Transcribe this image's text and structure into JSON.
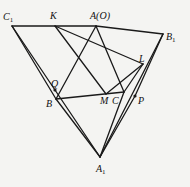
{
  "diagram": {
    "type": "geometry",
    "points": {
      "C1": {
        "x": 12,
        "y": 26,
        "label": "C",
        "sub": "1",
        "lx": 3,
        "ly": 20
      },
      "K": {
        "x": 55,
        "y": 26,
        "label": "K",
        "sub": "",
        "lx": 50,
        "ly": 19
      },
      "A": {
        "x": 96,
        "y": 26,
        "label": "A(O)",
        "sub": "",
        "lx": 90,
        "ly": 19
      },
      "B1": {
        "x": 163,
        "y": 34,
        "label": "B",
        "sub": "1",
        "lx": 166,
        "ly": 40
      },
      "L": {
        "x": 143,
        "y": 64,
        "label": "L",
        "sub": "",
        "lx": 139,
        "ly": 62
      },
      "Q": {
        "x": 55,
        "y": 90,
        "label": "Q",
        "sub": "",
        "lx": 51,
        "ly": 87
      },
      "B": {
        "x": 56,
        "y": 99,
        "label": "B",
        "sub": "",
        "lx": 46,
        "ly": 107
      },
      "M": {
        "x": 106,
        "y": 94,
        "label": "M",
        "sub": "",
        "lx": 100,
        "ly": 104
      },
      "C": {
        "x": 124,
        "y": 92,
        "label": "C",
        "sub": "",
        "lx": 112,
        "ly": 104
      },
      "P": {
        "x": 135,
        "y": 96,
        "label": "P",
        "sub": "",
        "lx": 138,
        "ly": 104
      },
      "A1": {
        "x": 100,
        "y": 157,
        "label": "A",
        "sub": "1",
        "lx": 96,
        "ly": 172
      }
    },
    "segments": [
      [
        "C1",
        "A"
      ],
      [
        "A",
        "B1"
      ],
      [
        "C1",
        "A1"
      ],
      [
        "B1",
        "A1"
      ],
      [
        "C1",
        "B"
      ],
      [
        "B",
        "A1"
      ],
      [
        "A",
        "B"
      ],
      [
        "A",
        "C"
      ],
      [
        "B",
        "C"
      ],
      [
        "K",
        "M"
      ],
      [
        "K",
        "L"
      ],
      [
        "M",
        "L"
      ],
      [
        "C",
        "L"
      ],
      [
        "C",
        "A1"
      ],
      [
        "B1",
        "P"
      ],
      [
        "P",
        "A1"
      ]
    ],
    "marked_points": [
      "Q",
      "P"
    ]
  }
}
